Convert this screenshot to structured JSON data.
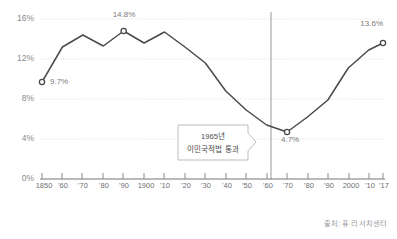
{
  "chart_data": {
    "type": "line",
    "title": "",
    "subtitle": "",
    "xlabel": "",
    "ylabel": "",
    "ylim": [
      0,
      17.2
    ],
    "xlim": [
      1850,
      2017
    ],
    "grid": true,
    "legend": false,
    "source": "출처: 퓨 리서치센터",
    "y_ticks": [
      "0%",
      "4%",
      "8%",
      "12%",
      "16%"
    ],
    "y_tick_values": [
      0,
      4,
      8,
      12,
      16
    ],
    "x_ticks": [
      "1850",
      "'60",
      "'70",
      "'80",
      "'90",
      "1900",
      "'10",
      "'20",
      "'30",
      "'40",
      "'50",
      "'60",
      "'70",
      "'80",
      "'90",
      "2000",
      "'10",
      "'17"
    ],
    "x_tick_values": [
      1850,
      1860,
      1870,
      1880,
      1890,
      1900,
      1910,
      1920,
      1930,
      1940,
      1950,
      1960,
      1970,
      1980,
      1990,
      2000,
      2010,
      2017
    ],
    "x": [
      1850,
      1860,
      1870,
      1880,
      1890,
      1900,
      1910,
      1920,
      1930,
      1940,
      1950,
      1960,
      1970,
      1980,
      1990,
      2000,
      2010,
      2017
    ],
    "values": [
      9.7,
      13.2,
      14.4,
      13.3,
      14.8,
      13.6,
      14.7,
      13.2,
      11.6,
      8.8,
      6.9,
      5.4,
      4.7,
      6.2,
      7.9,
      11.1,
      12.9,
      13.6
    ],
    "series": [
      {
        "name": "미국 내 이민자 비율",
        "values": [
          9.7,
          13.2,
          14.4,
          13.3,
          14.8,
          13.6,
          14.7,
          13.2,
          11.6,
          8.8,
          6.9,
          5.4,
          4.7,
          6.2,
          7.9,
          11.1,
          12.9,
          13.6
        ]
      }
    ],
    "annotations": [
      {
        "name": "first-point",
        "x": 1850,
        "value": 9.7,
        "label": "9.7%",
        "marker": true
      },
      {
        "name": "peak-point",
        "x": 1890,
        "value": 14.8,
        "label": "14.8%",
        "marker": true
      },
      {
        "name": "trough-point",
        "x": 1970,
        "value": 4.7,
        "label": "4.7%",
        "marker": true
      },
      {
        "name": "last-point",
        "x": 2017,
        "value": 13.6,
        "label": "13.6%",
        "marker": true
      }
    ],
    "callout": {
      "line1": "1965년",
      "line2": "이민국적법 통과",
      "vline_x": 1965
    },
    "colors": {
      "line": "#4a4a4a",
      "grid": "#dcdcdc",
      "axis": "#8a8a8a",
      "vline": "#9a9a9a",
      "tick_text": "#6f6f6f",
      "label_text": "#7a7a7a",
      "callout_border": "#b5b5b5",
      "background": "#ffffff"
    }
  }
}
